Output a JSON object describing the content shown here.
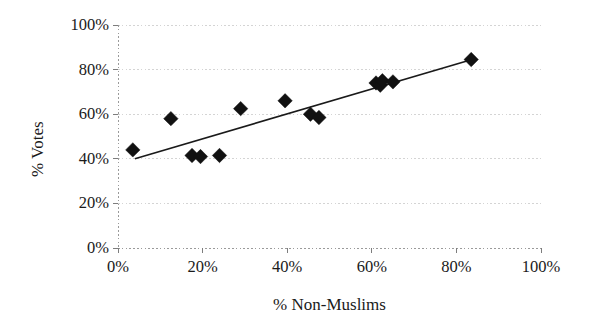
{
  "chart_data": {
    "type": "scatter",
    "title": "",
    "xlabel": "% Non-Muslims",
    "ylabel": "% Votes",
    "xlim": [
      0,
      100
    ],
    "ylim": [
      0,
      100
    ],
    "xtick_labels": [
      "0%",
      "20%",
      "40%",
      "60%",
      "80%",
      "100%"
    ],
    "xtick_values": [
      0,
      20,
      40,
      60,
      80,
      100
    ],
    "ytick_labels": [
      "0%",
      "20%",
      "40%",
      "60%",
      "80%",
      "100%"
    ],
    "ytick_values": [
      0,
      20,
      40,
      60,
      80,
      100
    ],
    "grid": "horizontal",
    "legend": "none",
    "marker": "filled-diamond",
    "marker_color": "#111111",
    "series": [
      {
        "name": "Constituencies",
        "type": "scatter",
        "points": [
          {
            "x": 3.5,
            "y": 44.0
          },
          {
            "x": 12.5,
            "y": 58.0
          },
          {
            "x": 17.5,
            "y": 41.5
          },
          {
            "x": 19.5,
            "y": 41.0
          },
          {
            "x": 24.0,
            "y": 41.5
          },
          {
            "x": 29.0,
            "y": 62.5
          },
          {
            "x": 39.5,
            "y": 66.0
          },
          {
            "x": 45.5,
            "y": 60.0
          },
          {
            "x": 47.5,
            "y": 58.5
          },
          {
            "x": 61.0,
            "y": 74.0
          },
          {
            "x": 62.0,
            "y": 73.0
          },
          {
            "x": 62.5,
            "y": 75.0
          },
          {
            "x": 65.0,
            "y": 74.5
          },
          {
            "x": 83.5,
            "y": 84.5
          }
        ]
      },
      {
        "name": "Trend line",
        "type": "line",
        "color": "#1a1a1a",
        "points": [
          {
            "x": 4.0,
            "y": 40.0
          },
          {
            "x": 84.5,
            "y": 85.0
          }
        ]
      }
    ]
  }
}
